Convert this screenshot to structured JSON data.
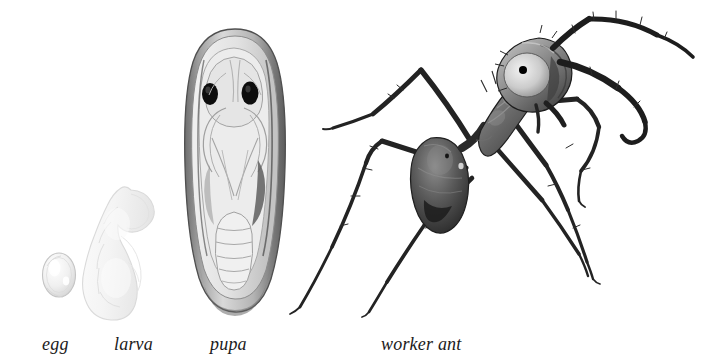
{
  "figure": {
    "background_color": "#ffffff",
    "ink_color": "#1b1b1b",
    "width": 703,
    "height": 362,
    "style": "grayscale scientific illustration"
  },
  "labels": {
    "egg": "egg",
    "larva": "larva",
    "pupa": "pupa",
    "worker_ant": "worker ant"
  },
  "stages": [
    {
      "key": "egg",
      "label": "egg",
      "order": 1,
      "icon": "ant-egg-icon",
      "description": "small pale oval egg",
      "bbox": [
        42,
        253,
        34,
        45
      ],
      "fill": "#f2f2f2",
      "stroke": "#c9c9c9"
    },
    {
      "key": "larva",
      "label": "larva",
      "order": 2,
      "icon": "ant-larva-icon",
      "description": "pale curved grub with segmented body",
      "bbox": [
        88,
        188,
        82,
        122
      ],
      "fill": "#f7f7f7",
      "stroke": "#d8d8d8"
    },
    {
      "key": "pupa",
      "label": "pupa",
      "order": 3,
      "icon": "ant-pupa-icon",
      "description": "elongated cocoon showing developing ant with two dark eyes, folded legs and segmented gaster",
      "bbox": [
        188,
        28,
        94,
        284
      ],
      "fill": "#e8e8e8",
      "stroke": "#6b6b6b",
      "eye_color": "#101010"
    },
    {
      "key": "worker_ant",
      "label": "worker ant",
      "order": 4,
      "icon": "worker-ant-icon",
      "description": "adult worker ant in profile with head, thorax, gaster, six legs and two elbowed antennae",
      "bbox": [
        296,
        14,
        300,
        300
      ],
      "body_color": "#2a2a2a",
      "head_highlight": "#c9c9c9",
      "eye_color": "#ffffff",
      "pupil_color": "#000000"
    }
  ],
  "colors": {
    "paper": "#ffffff",
    "ink": "#1b1b1b",
    "dark": "#242424",
    "mid_gray": "#7d7d7d",
    "light_gray": "#cfcfcf",
    "pale": "#f2f2f2"
  }
}
